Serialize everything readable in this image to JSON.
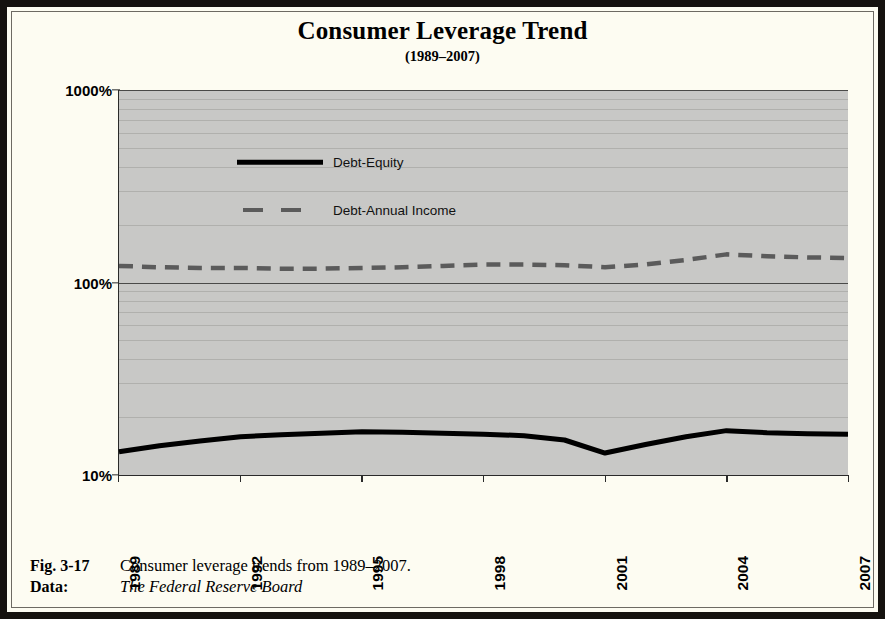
{
  "figure": {
    "title": "Consumer Leverage Trend",
    "subtitle": "(1989–2007)",
    "caption_label": "Fig. 3-17",
    "caption_text": "Consumer leverage trends from 1989–2007.",
    "data_label": "Data:",
    "data_source": "The Federal Reserve Board"
  },
  "colors": {
    "plot_background": "#c8c8c6",
    "page_background": "#fdfcf2",
    "frame": "#15120f",
    "series_debt_equity": "#000000",
    "series_debt_income": "#5b5b5b",
    "gridline": "#9a9a97",
    "axis": "#2a2a2a"
  },
  "chart_data": {
    "type": "line",
    "title": "Consumer Leverage Trend",
    "subtitle": "(1989–2007)",
    "xlabel": "",
    "ylabel": "",
    "yscale": "log",
    "ylim": [
      10,
      1000
    ],
    "ytick_labels": [
      "1000%",
      "100%",
      "10%"
    ],
    "ytick_values": [
      1000,
      100,
      10
    ],
    "minor_gridlines": true,
    "grid": true,
    "legend_position": "upper-left-inside",
    "xtick_labels": [
      "1989",
      "1992",
      "1995",
      "1998",
      "2001",
      "2004",
      "2007"
    ],
    "xtick_values": [
      1989,
      1992,
      1995,
      1998,
      2001,
      2004,
      2007
    ],
    "x": [
      1989,
      1990,
      1991,
      1992,
      1993,
      1994,
      1995,
      1996,
      1997,
      1998,
      1999,
      2000,
      2001,
      2002,
      2003,
      2004,
      2005,
      2006,
      2007
    ],
    "series": [
      {
        "name": "Debt-Equity",
        "style": "solid",
        "color": "#000000",
        "values": [
          13.2,
          14.2,
          15.0,
          15.8,
          16.2,
          16.5,
          16.8,
          16.7,
          16.5,
          16.3,
          16.0,
          15.2,
          13.0,
          14.4,
          15.8,
          17.0,
          16.6,
          16.4,
          16.3
        ]
      },
      {
        "name": "Debt-Annual Income",
        "style": "dashed",
        "color": "#5b5b5b",
        "values": [
          122,
          120,
          119,
          119,
          118,
          118,
          119,
          120,
          122,
          124,
          124,
          123,
          120,
          124,
          131,
          140,
          137,
          135,
          134
        ]
      }
    ]
  },
  "legend": {
    "items": [
      {
        "label": "Debt-Equity",
        "style": "solid"
      },
      {
        "label": "Debt-Annual Income",
        "style": "dashed"
      }
    ]
  }
}
